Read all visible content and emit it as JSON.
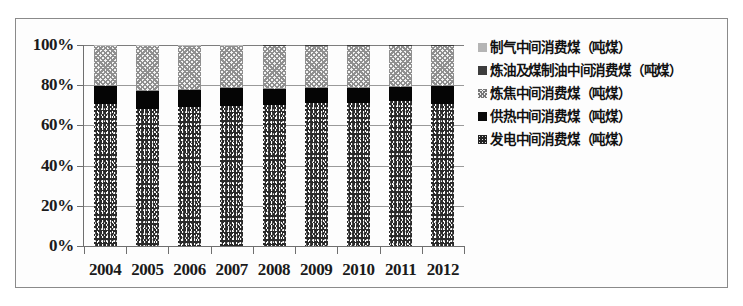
{
  "chart_data": {
    "type": "bar",
    "stacked": true,
    "normalized": true,
    "title": "",
    "subtitle": "",
    "xlabel": "",
    "ylabel": "",
    "categories": [
      "2004",
      "2005",
      "2006",
      "2007",
      "2008",
      "2009",
      "2010",
      "2011",
      "2012"
    ],
    "ytick_labels": [
      "0%",
      "20%",
      "40%",
      "60%",
      "80%",
      "100%"
    ],
    "ytick_values": [
      0,
      20,
      40,
      60,
      80,
      100
    ],
    "ylim": [
      0,
      100
    ],
    "grid": true,
    "legend_position": "right",
    "series": [
      {
        "name": "发电中间消费煤（吨煤）",
        "marker": "fadian",
        "values": [
          70.6,
          68.3,
          69.0,
          69.6,
          70.4,
          71.0,
          71.4,
          71.9,
          70.9
        ]
      },
      {
        "name": "供热中间消费煤（吨煤）",
        "marker": "gongre",
        "values": [
          9.0,
          8.9,
          8.7,
          9.1,
          7.8,
          7.8,
          7.2,
          7.1,
          8.6
        ]
      },
      {
        "name": "炼焦中间消费煤（吨煤）",
        "marker": "lianjiao",
        "values": [
          19.8,
          22.2,
          21.7,
          20.7,
          21.3,
          20.7,
          20.9,
          20.6,
          20.1
        ]
      },
      {
        "name": "炼油及煤制油中间消费煤（吨煤）",
        "marker": "lianyou",
        "values": [
          0.3,
          0.3,
          0.3,
          0.3,
          0.3,
          0.3,
          0.3,
          0.2,
          0.2
        ]
      },
      {
        "name": "制气中间消费煤（吨煤）",
        "marker": "zhiqi",
        "values": [
          0.3,
          0.3,
          0.3,
          0.3,
          0.2,
          0.2,
          0.2,
          0.2,
          0.2
        ]
      }
    ]
  },
  "legend": {
    "items": [
      {
        "label": "制气中间消费煤（吨煤）",
        "marker": "zhiqi"
      },
      {
        "label": "炼油及煤制油中间消费煤（吨煤）",
        "marker": "lianyou"
      },
      {
        "label": "炼焦中间消费煤（吨煤）",
        "marker": "lianjiao"
      },
      {
        "label": "供热中间消费煤（吨煤）",
        "marker": "gongre"
      },
      {
        "label": "发电中间消费煤（吨煤）",
        "marker": "fadian"
      }
    ]
  }
}
